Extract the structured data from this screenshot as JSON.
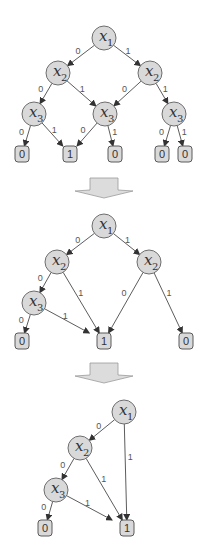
{
  "colors": {
    "node_fill": "#d9d9d9",
    "node_stroke": "#6e6e6e",
    "edge": "#4a4a4a",
    "background": "#ffffff"
  },
  "diagrams": [
    {
      "name": "full-decision-tree",
      "nodes": [
        {
          "id": "a1",
          "var": "x",
          "sub": "1",
          "x": 104,
          "y": 38
        },
        {
          "id": "a2",
          "var": "x",
          "sub": "2",
          "x": 58,
          "y": 73
        },
        {
          "id": "a3",
          "var": "x",
          "sub": "2",
          "x": 150,
          "y": 73
        },
        {
          "id": "a4",
          "var": "x",
          "sub": "3",
          "x": 34,
          "y": 114
        },
        {
          "id": "a5",
          "var": "x",
          "sub": "3",
          "x": 105,
          "y": 114
        },
        {
          "id": "a6",
          "var": "x",
          "sub": "3",
          "x": 174,
          "y": 114
        }
      ],
      "leaves": [
        {
          "id": "al1",
          "value": "0",
          "x": 22,
          "y": 154
        },
        {
          "id": "al2",
          "value": "1",
          "x": 70,
          "y": 154
        },
        {
          "id": "al3",
          "value": "0",
          "x": 115,
          "y": 154
        },
        {
          "id": "al4",
          "value": "0",
          "x": 162,
          "y": 154
        },
        {
          "id": "al5",
          "value": "0",
          "x": 185,
          "y": 154
        }
      ],
      "edges": [
        {
          "from": "a1",
          "to": "a2",
          "label": "0"
        },
        {
          "from": "a1",
          "to": "a3",
          "label": "1"
        },
        {
          "from": "a2",
          "to": "a4",
          "label": "0"
        },
        {
          "from": "a2",
          "to": "a5",
          "label": "1"
        },
        {
          "from": "a3",
          "to": "a5",
          "label": "0"
        },
        {
          "from": "a3",
          "to": "a6",
          "label": "1"
        },
        {
          "from": "a4",
          "to": "al1",
          "label": "0"
        },
        {
          "from": "a4",
          "to": "al2",
          "label": "1"
        },
        {
          "from": "a5",
          "to": "al2",
          "label": "0"
        },
        {
          "from": "a5",
          "to": "al3",
          "label": "1"
        },
        {
          "from": "a6",
          "to": "al4",
          "label": "0"
        },
        {
          "from": "a6",
          "to": "al5",
          "label": "1"
        }
      ]
    },
    {
      "name": "partially-reduced-diagram",
      "nodes": [
        {
          "id": "b1",
          "var": "x",
          "sub": "1",
          "x": 104,
          "y": 226
        },
        {
          "id": "b2",
          "var": "x",
          "sub": "2",
          "x": 57,
          "y": 262
        },
        {
          "id": "b3",
          "var": "x",
          "sub": "2",
          "x": 149,
          "y": 262
        },
        {
          "id": "b4",
          "var": "x",
          "sub": "3",
          "x": 34,
          "y": 303
        }
      ],
      "leaves": [
        {
          "id": "bl1",
          "value": "0",
          "x": 22,
          "y": 341
        },
        {
          "id": "bl2",
          "value": "1",
          "x": 104,
          "y": 341
        },
        {
          "id": "bl3",
          "value": "0",
          "x": 186,
          "y": 341
        }
      ],
      "edges": [
        {
          "from": "b1",
          "to": "b2",
          "label": "0"
        },
        {
          "from": "b1",
          "to": "b3",
          "label": "1"
        },
        {
          "from": "b2",
          "to": "b4",
          "label": "0"
        },
        {
          "from": "b2",
          "to": "bl2",
          "label": "1"
        },
        {
          "from": "b3",
          "to": "bl2",
          "label": "0"
        },
        {
          "from": "b3",
          "to": "bl3",
          "label": "1"
        },
        {
          "from": "b4",
          "to": "bl1",
          "label": "0"
        },
        {
          "from": "b4",
          "to": "bl2",
          "label": "1"
        }
      ]
    },
    {
      "name": "reduced-bdd",
      "nodes": [
        {
          "id": "c1",
          "var": "x",
          "sub": "1",
          "x": 124,
          "y": 412
        },
        {
          "id": "c2",
          "var": "x",
          "sub": "2",
          "x": 80,
          "y": 448
        },
        {
          "id": "c3",
          "var": "x",
          "sub": "3",
          "x": 56,
          "y": 490
        }
      ],
      "leaves": [
        {
          "id": "cl1",
          "value": "0",
          "x": 45,
          "y": 528
        },
        {
          "id": "cl2",
          "value": "1",
          "x": 127,
          "y": 528
        }
      ],
      "edges": [
        {
          "from": "c1",
          "to": "c2",
          "label": "0"
        },
        {
          "from": "c1",
          "to": "cl2",
          "label": "1"
        },
        {
          "from": "c2",
          "to": "c3",
          "label": "0"
        },
        {
          "from": "c2",
          "to": "cl2",
          "label": "1"
        },
        {
          "from": "c3",
          "to": "cl1",
          "label": "0"
        },
        {
          "from": "c3",
          "to": "cl2",
          "label": "1"
        }
      ]
    }
  ],
  "transition_arrows": [
    {
      "name": "reduce-arrow-1",
      "cx": 104,
      "top": 178
    },
    {
      "name": "reduce-arrow-2",
      "cx": 104,
      "top": 363
    }
  ]
}
